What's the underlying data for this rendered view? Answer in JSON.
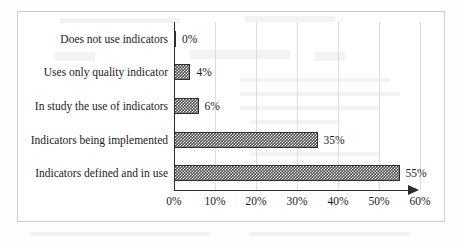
{
  "chart_data": {
    "type": "bar",
    "orientation": "horizontal",
    "title": "",
    "subtitle": "",
    "xlabel": "",
    "ylabel": "",
    "categories": [
      "Does not use indicators",
      "Uses only quality indicator",
      "In study the use of indicators",
      "Indicators being implemented",
      "Indicators defined and in use"
    ],
    "values": [
      0,
      4,
      6,
      35,
      55
    ],
    "value_labels": [
      "0%",
      "4%",
      "6%",
      "35%",
      "55%"
    ],
    "xlim": [
      0,
      60
    ],
    "xticks": [
      0,
      10,
      20,
      30,
      40,
      50,
      60
    ],
    "xtick_labels": [
      "0%",
      "10%",
      "20%",
      "30%",
      "40%",
      "50%",
      "60%"
    ],
    "grid": "vertical",
    "legend": "none",
    "bar_fill": "#4a4a4a",
    "bar_pattern": "checkerboard",
    "bar_edge_color": "#2e2e2e",
    "axis_color": "#2b2b2b",
    "gridline_color": "#dcdcdc",
    "frame_color": "#cfcfcf",
    "axis_arrow": true
  }
}
